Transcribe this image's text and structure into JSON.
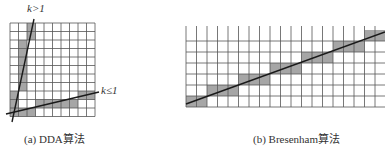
{
  "figure": {
    "panel_a": {
      "caption": "(a) DDA算法",
      "label_steep": "k>1",
      "label_shallow": "k≤1",
      "grid": {
        "cols": 10,
        "rows": 11
      },
      "shaded_cells": [
        [
          2,
          0
        ],
        [
          2,
          1
        ],
        [
          1,
          2
        ],
        [
          1,
          3
        ],
        [
          1,
          4
        ],
        [
          1,
          5
        ],
        [
          1,
          6
        ],
        [
          1,
          7
        ],
        [
          0,
          8
        ],
        [
          0,
          9
        ],
        [
          0,
          10
        ],
        [
          1,
          10
        ],
        [
          2,
          10
        ],
        [
          3,
          9
        ],
        [
          4,
          9
        ],
        [
          5,
          9
        ],
        [
          6,
          9
        ],
        [
          7,
          9
        ],
        [
          8,
          8
        ],
        [
          9,
          8
        ]
      ],
      "lines": [
        {
          "name": "steep-line",
          "desc": "k>1"
        },
        {
          "name": "shallow-line",
          "desc": "k≤1"
        }
      ]
    },
    "panel_b": {
      "caption": "(b) Bresenham算法",
      "grid": {
        "cols": 19,
        "rows": 7
      },
      "shaded_cells": [
        [
          0,
          6
        ],
        [
          1,
          6
        ],
        [
          2,
          5
        ],
        [
          3,
          5
        ],
        [
          4,
          5
        ],
        [
          5,
          4
        ],
        [
          6,
          4
        ],
        [
          7,
          4
        ],
        [
          8,
          3
        ],
        [
          9,
          3
        ],
        [
          10,
          3
        ],
        [
          11,
          2
        ],
        [
          12,
          2
        ],
        [
          13,
          2
        ],
        [
          14,
          1
        ],
        [
          15,
          1
        ],
        [
          16,
          1
        ],
        [
          17,
          0
        ],
        [
          18,
          0
        ]
      ]
    },
    "colors": {
      "grid_line": "#555555",
      "shade": "#a6a6a6",
      "line": "#1a1a1a",
      "background": "#ffffff"
    }
  }
}
